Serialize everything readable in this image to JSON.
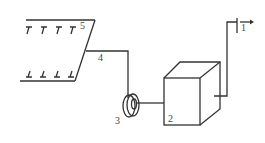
{
  "diagram": {
    "labels": {
      "outlet": "1",
      "tank": "2",
      "pump": "3",
      "pipe": "4",
      "collector": "5"
    },
    "colors": {
      "line": "#333333",
      "text": "#444444",
      "background": "#ffffff"
    }
  }
}
